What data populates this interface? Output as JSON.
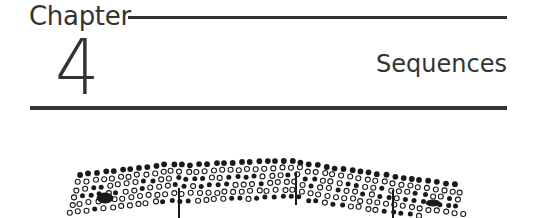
{
  "header": {
    "chapter_label": "Chapter",
    "chapter_number": "4",
    "chapter_title": "Sequences"
  },
  "figure": {
    "filled_color": "#1a1a1a",
    "open_color": "#1a1a1a"
  }
}
